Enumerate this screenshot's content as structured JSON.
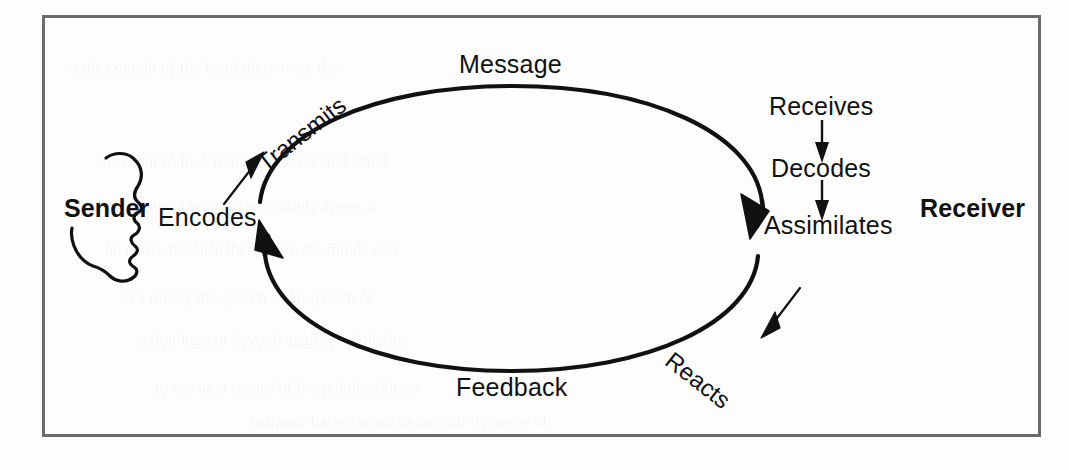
{
  "figure": {
    "type": "communication-cycle-diagram",
    "frame": {
      "border_color": "#6b6b6b",
      "background": "#fdfdfd"
    },
    "ink_color": "#111111"
  },
  "actors": [
    {
      "id": "sender",
      "label": "Sender",
      "side": "left",
      "face_direction": "right"
    },
    {
      "id": "receiver",
      "label": "Receiver",
      "side": "right",
      "face_direction": "left"
    }
  ],
  "cycle": {
    "top_arc_label": "Message",
    "bottom_arc_label": "Feedback",
    "top_arc_direction": "sender-to-receiver",
    "bottom_arc_direction": "receiver-to-sender"
  },
  "sender_steps": [
    {
      "label": "Encodes"
    },
    {
      "label": "Transmits"
    }
  ],
  "receiver_steps": [
    {
      "label": "Receives"
    },
    {
      "label": "Decodes"
    },
    {
      "label": "Assimilates"
    },
    {
      "label": "Reacts"
    }
  ],
  "bleed_text": [
    "a the contain of the hand there were the",
    "an colour to be a tree and a serve and stand",
    "ballance have a word to an entirely agree of",
    "an entire  because there were the minds and",
    "to a ninety  the speech  to an speech or",
    "action  human  beyond  against  whole  the",
    "to see an a record of the  public  address"
  ]
}
